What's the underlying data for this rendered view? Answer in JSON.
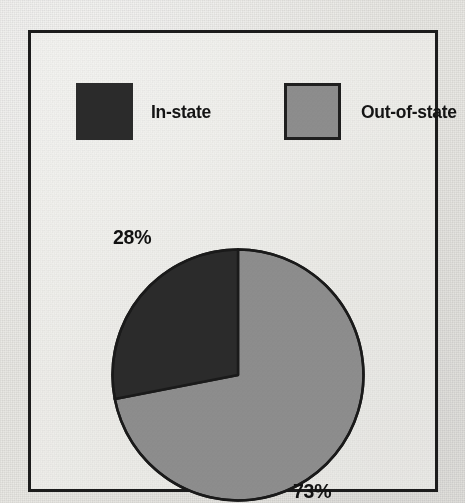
{
  "chart_data": {
    "type": "pie",
    "title": "",
    "categories": [
      "In-state",
      "Out-of-state"
    ],
    "values": [
      28,
      73
    ],
    "value_labels": [
      "28%",
      "73%"
    ],
    "unit": "%",
    "legend_position": "top",
    "grid": false,
    "start_angle_deg": 0,
    "direction": "counterclockwise",
    "slices": [
      {
        "label": "In-state",
        "value": 28,
        "value_label": "28%",
        "color": "#2b2b2b",
        "sweep_deg": 101,
        "label_position": "upper-left"
      },
      {
        "label": "Out-of-state",
        "value": 73,
        "value_label": "73%",
        "color": "#8d8d8d",
        "sweep_deg": 259,
        "label_position": "lower-right"
      }
    ]
  },
  "legend": {
    "items": [
      {
        "label": "In-state",
        "swatch_color": "#2b2b2b",
        "swatch_border": "none"
      },
      {
        "label": "Out-of-state",
        "swatch_color": "#8d8d8d",
        "swatch_border": "#1f1f1f"
      }
    ]
  },
  "labels": {
    "instate_percent": "28%",
    "outstate_percent": "73%"
  },
  "colors": {
    "background": "#e8e7e3",
    "frame": "#1c1c1c",
    "dark_slice": "#2b2b2b",
    "gray_slice": "#8d8d8d",
    "outline": "#1a1a1a",
    "text": "#141414"
  }
}
